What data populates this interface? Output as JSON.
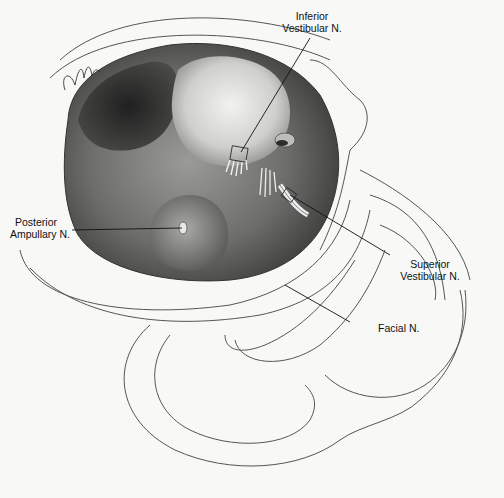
{
  "figure": {
    "signature": "artist-signature",
    "labels": {
      "inferior_vestibular": {
        "line1": "Inferior",
        "line2": "Vestibular N."
      },
      "posterior_ampullary": {
        "line1": "Posterior",
        "line2": "Ampullary N."
      },
      "superior_vestibular": {
        "line1": "Superior",
        "line2": "Vestibular N."
      },
      "facial": {
        "line1": "Facial N."
      }
    }
  },
  "colors": {
    "background": "#f8f8f7",
    "outline": "#444444",
    "shade_dark": "#2a2a2a",
    "shade_mid": "#7a7a7a",
    "shade_light": "#d8d8d6"
  }
}
